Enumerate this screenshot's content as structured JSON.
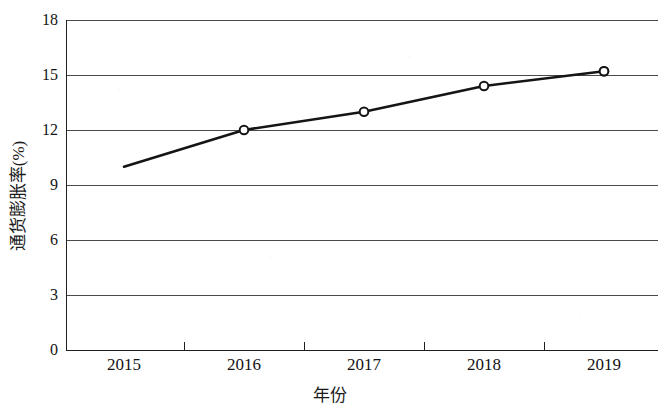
{
  "chart_data": {
    "type": "line",
    "title": "",
    "subtitle": "",
    "xlabel": "年份",
    "ylabel": "通货膨胀率(%)",
    "categories": [
      "2015",
      "2016",
      "2017",
      "2018",
      "2019"
    ],
    "x": [
      2015,
      2016,
      2017,
      2018,
      2019
    ],
    "values": [
      10.0,
      12.0,
      13.0,
      14.4,
      15.2
    ],
    "series": [
      {
        "name": "通货膨胀率(%)",
        "values": [
          10.0,
          12.0,
          13.0,
          14.4,
          15.2
        ]
      }
    ],
    "ylim": [
      0,
      18
    ],
    "yticks": [
      0,
      3,
      6,
      9,
      12,
      15,
      18
    ],
    "ytick_labels": [
      "0",
      "3",
      "6",
      "9",
      "12",
      "15",
      "18"
    ],
    "xtick_labels": [
      "2015",
      "2016",
      "2017",
      "2018",
      "2019"
    ],
    "grid": "horizontal",
    "legend": "none",
    "marker": "open-circle",
    "line_color": "#1a1a1a",
    "grid_color": "#555555",
    "axis_color": "#222222",
    "background_color": "#ffffff",
    "annotations": []
  },
  "axes": {
    "y_title": "通货膨胀率(%)",
    "x_title": "年份"
  },
  "yticks": [
    {
      "label": "18"
    },
    {
      "label": "15"
    },
    {
      "label": "12"
    },
    {
      "label": "9"
    },
    {
      "label": "6"
    },
    {
      "label": "3"
    },
    {
      "label": "0"
    }
  ],
  "xticks": [
    {
      "label": "2015"
    },
    {
      "label": "2016"
    },
    {
      "label": "2017"
    },
    {
      "label": "2018"
    },
    {
      "label": "2019"
    }
  ]
}
